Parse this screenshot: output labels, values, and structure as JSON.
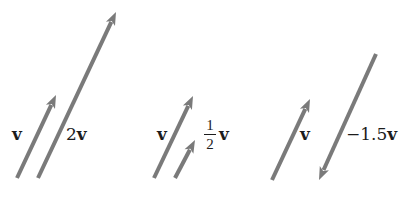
{
  "diagram": {
    "colors": {
      "arrow": "#7a7a7a",
      "text": "#1c1c1c",
      "background": "#ffffff"
    },
    "groups": [
      {
        "name": "v-and-2v",
        "arrows": [
          {
            "label": "v",
            "tail": [
              17,
              178
            ],
            "tip": [
              56,
              95
            ]
          },
          {
            "label": "2v",
            "tail": [
              38,
              178
            ],
            "tip": [
              116,
              12
            ]
          }
        ]
      },
      {
        "name": "v-and-half-v",
        "arrows": [
          {
            "label": "v",
            "tail": [
              154,
              178
            ],
            "tip": [
              193,
              96
            ]
          },
          {
            "label": "1/2 v",
            "tail": [
              175,
              178
            ],
            "tip": [
              195,
              140
            ]
          }
        ]
      },
      {
        "name": "v-and-neg-1.5v",
        "arrows": [
          {
            "label": "v",
            "tail": [
              272,
              180
            ],
            "tip": [
              310,
              99
            ]
          },
          {
            "label": "-1.5v",
            "tail": [
              376,
              54
            ],
            "tip": [
              319,
              180
            ]
          }
        ]
      }
    ],
    "labels": {
      "g1_v": "v",
      "g1_2v_coef": "2",
      "g1_2v_var": "v",
      "g2_v": "v",
      "g2_half_num": "1",
      "g2_half_den": "2",
      "g2_half_var": "v",
      "g3_v": "v",
      "g3_neg_coef": "−1.5",
      "g3_neg_var": "v"
    }
  }
}
